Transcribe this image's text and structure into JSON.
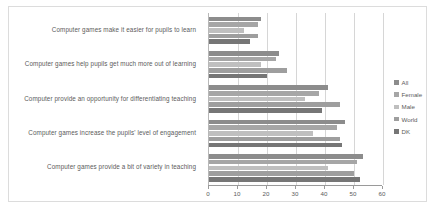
{
  "chart_data": {
    "type": "bar",
    "orientation": "horizontal",
    "title": "",
    "xlabel": "",
    "ylabel": "",
    "xlim": [
      0,
      60
    ],
    "xticks": [
      0,
      10,
      20,
      30,
      40,
      50,
      60
    ],
    "grid": true,
    "legend_position": "right",
    "categories": [
      "Computer games make it easier for pupils to learn",
      "Computer games help pupils get much more out of learning",
      "Computer provide an opportunity for differentiating teaching",
      "Computer games increase the pupils' level of engagement",
      "Computer games provide a bit of variety in teaching"
    ],
    "series": [
      {
        "name": "All",
        "color": "#8c8c8c",
        "values": [
          18,
          24,
          41,
          47,
          53
        ]
      },
      {
        "name": "Female",
        "color": "#a6a6a6",
        "values": [
          17,
          23,
          38,
          44,
          51
        ]
      },
      {
        "name": "Male",
        "color": "#bfbfbf",
        "values": [
          12,
          18,
          33,
          36,
          41
        ]
      },
      {
        "name": "World",
        "color": "#9e9e9e",
        "values": [
          17,
          27,
          45,
          45,
          50
        ]
      },
      {
        "name": "DK",
        "color": "#767676",
        "values": [
          14,
          20,
          39,
          46,
          52
        ]
      }
    ]
  },
  "legend": {
    "items": [
      {
        "label": "All"
      },
      {
        "label": "Female"
      },
      {
        "label": "Male"
      },
      {
        "label": "World"
      },
      {
        "label": "DK"
      }
    ]
  },
  "axis": {
    "tick_labels": [
      "0",
      "10",
      "20",
      "30",
      "40",
      "50",
      "60"
    ]
  }
}
